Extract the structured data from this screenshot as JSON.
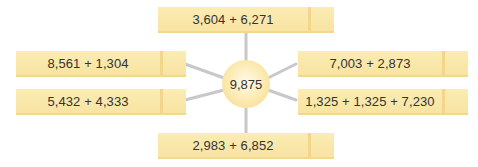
{
  "center": {
    "value": "9,875"
  },
  "boxes": [
    {
      "position": "top",
      "expression": "3,604 + 6,271"
    },
    {
      "position": "upper-left",
      "expression": "8,561 + 1,304"
    },
    {
      "position": "upper-right",
      "expression": "7,003 + 2,873"
    },
    {
      "position": "lower-left",
      "expression": "5,432 + 4,333"
    },
    {
      "position": "lower-right",
      "expression": "1,325 + 1,325 + 7,230"
    },
    {
      "position": "bottom",
      "expression": "2,983 + 6,852"
    }
  ],
  "colors": {
    "box_fill": "#f9e8aa",
    "box_accent": "#f3d68c",
    "connector": "#c8c8cc",
    "text": "#333333"
  }
}
